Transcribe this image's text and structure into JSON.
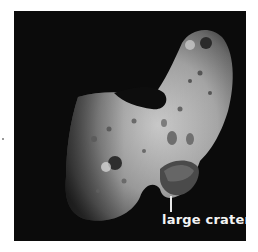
{
  "image": {
    "subject": "asteroid",
    "description": "Grayscale photograph of an elongated, cratered asteroid against black space"
  },
  "annotation": {
    "label": "large crater"
  },
  "colors": {
    "background": "#ffffff",
    "space": "#0b0b0b",
    "label_text": "#f4f4f4"
  }
}
